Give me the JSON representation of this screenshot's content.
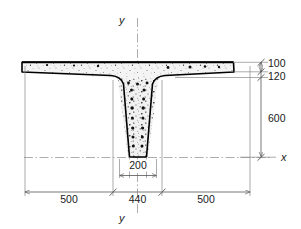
{
  "figure": {
    "type": "engineering-cross-section-drawing",
    "units_note": "",
    "axes": {
      "vertical_label": "y",
      "vertical_label_bottom": "y",
      "horizontal_label": "x"
    },
    "dimensions": {
      "flange_thickness_top": "100",
      "flange_thickness_total": "120",
      "web_depth": "600",
      "web_width_bottom": "200",
      "web_width_top": "440",
      "flange_overhang_left": "500",
      "flange_overhang_right": "500"
    },
    "labels": [
      {
        "id": "dim-100",
        "text": "100"
      },
      {
        "id": "dim-120",
        "text": "120"
      },
      {
        "id": "dim-600",
        "text": "600"
      },
      {
        "id": "dim-200",
        "text": "200"
      },
      {
        "id": "dim-440",
        "text": "440"
      },
      {
        "id": "dim-500-left",
        "text": "500"
      },
      {
        "id": "dim-500-right",
        "text": "500"
      },
      {
        "id": "axis-y-top",
        "text": "y"
      },
      {
        "id": "axis-y-bottom",
        "text": "y"
      },
      {
        "id": "axis-x",
        "text": "x"
      }
    ],
    "colors": {
      "outline": "#000000",
      "dimension": "#555555",
      "extension": "#888888",
      "centerline": "#999999",
      "concrete_fill": "#f2f2f2",
      "aggregate": "#111111",
      "background": "#ffffff"
    }
  }
}
